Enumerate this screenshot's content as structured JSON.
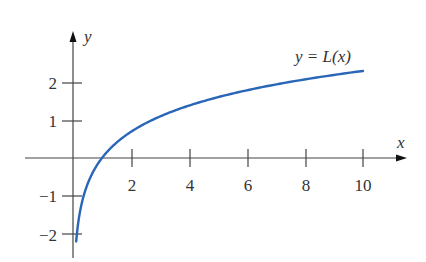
{
  "chart_data": {
    "type": "line",
    "title": "",
    "function": "L(x) = ln(x)",
    "xlabel": "x",
    "ylabel": "y",
    "xlim": [
      -1.7,
      11.5
    ],
    "ylim": [
      -2.5,
      2.8
    ],
    "x_ticks": [
      2,
      4,
      6,
      8,
      10
    ],
    "x_tick_labels": [
      "2",
      "4",
      "6",
      "8",
      "10"
    ],
    "y_ticks": [
      -2,
      -1,
      1,
      2
    ],
    "y_tick_labels": [
      "−2",
      "−1",
      "1",
      "2"
    ],
    "grid": false,
    "legend": null,
    "annotations": [
      {
        "text": "y = L(x)",
        "x": 9,
        "y": 2.6
      }
    ],
    "series": [
      {
        "name": "y = L(x)",
        "color": "#2a66b8",
        "x": [
          0.11,
          0.2,
          0.3,
          0.5,
          0.75,
          1,
          1.5,
          2,
          3,
          4,
          5,
          6,
          7,
          8,
          9,
          10
        ],
        "y": [
          -2.2,
          -1.61,
          -1.2,
          -0.69,
          -0.29,
          0,
          0.41,
          0.69,
          1.1,
          1.39,
          1.61,
          1.79,
          1.95,
          2.08,
          2.2,
          2.3
        ]
      }
    ]
  },
  "labels": {
    "x_axis": "x",
    "y_axis": "y",
    "curve": "y = L(x)",
    "xt": [
      "2",
      "4",
      "6",
      "8",
      "10"
    ],
    "yt": [
      "2",
      "1",
      "−1",
      "−2"
    ]
  }
}
